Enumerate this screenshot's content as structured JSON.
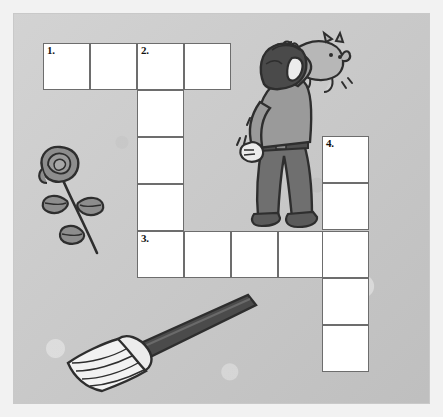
{
  "page": {
    "background_color": "#c9c9c9",
    "cell_fill": "#ffffff",
    "cell_border": "#6d6d6d",
    "ink_color": "#3c3c3c"
  },
  "crossword": {
    "cell_size": 47,
    "clue_numbers": [
      "1.",
      "2.",
      "3.",
      "4."
    ],
    "entries": [
      {
        "number": "1.",
        "direction": "across",
        "length": 4,
        "start_col": 0,
        "start_row": 0
      },
      {
        "number": "2.",
        "direction": "down",
        "length": 5,
        "start_col": 2,
        "start_row": 0
      },
      {
        "number": "3.",
        "direction": "across",
        "length": 5,
        "start_col": 2,
        "start_row": 4
      },
      {
        "number": "4.",
        "direction": "down",
        "length": 5,
        "start_col": 6,
        "start_row": 2
      }
    ],
    "cells": [
      {
        "id": "r0c0",
        "x": 43,
        "y": 43,
        "number": "1.",
        "value": ""
      },
      {
        "id": "r0c1",
        "x": 90,
        "y": 43,
        "number": "",
        "value": ""
      },
      {
        "id": "r0c2",
        "x": 137,
        "y": 43,
        "number": "2.",
        "value": ""
      },
      {
        "id": "r0c3",
        "x": 184,
        "y": 43,
        "number": "",
        "value": ""
      },
      {
        "id": "r1c2",
        "x": 137,
        "y": 90,
        "number": "",
        "value": ""
      },
      {
        "id": "r2c2",
        "x": 137,
        "y": 137,
        "number": "",
        "value": ""
      },
      {
        "id": "r3c2",
        "x": 137,
        "y": 184,
        "number": "",
        "value": ""
      },
      {
        "id": "r4c2",
        "x": 137,
        "y": 231,
        "number": "3.",
        "value": ""
      },
      {
        "id": "r4c3",
        "x": 184,
        "y": 231,
        "number": "",
        "value": ""
      },
      {
        "id": "r4c4",
        "x": 231,
        "y": 231,
        "number": "",
        "value": ""
      },
      {
        "id": "r4c5",
        "x": 278,
        "y": 231,
        "number": "",
        "value": ""
      },
      {
        "id": "r2c6",
        "x": 322,
        "y": 136,
        "number": "4.",
        "value": ""
      },
      {
        "id": "r3c6",
        "x": 322,
        "y": 183,
        "number": "",
        "value": ""
      },
      {
        "id": "r4c6",
        "x": 322,
        "y": 231,
        "number": "",
        "value": ""
      },
      {
        "id": "r5c6",
        "x": 322,
        "y": 278,
        "number": "",
        "value": ""
      },
      {
        "id": "r6c6",
        "x": 322,
        "y": 325,
        "number": "",
        "value": ""
      }
    ]
  },
  "illustrations": [
    {
      "name": "rose-illustration",
      "label": "rose",
      "x": 33,
      "y": 143,
      "width": 80,
      "height": 115
    },
    {
      "name": "boy-cat-illustration",
      "label": "boy holding cat",
      "x": 228,
      "y": 28,
      "width": 120,
      "height": 205
    },
    {
      "name": "broom-illustration",
      "label": "broom",
      "x": 60,
      "y": 293,
      "width": 200,
      "height": 100
    }
  ]
}
